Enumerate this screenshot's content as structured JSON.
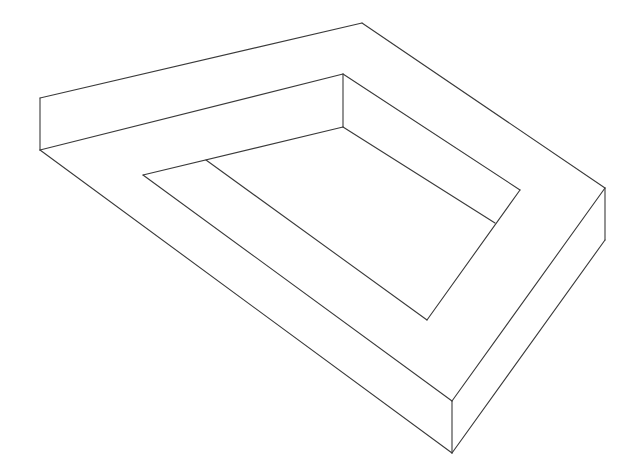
{
  "figure": {
    "background": "#ffffff",
    "stroke": "#3a3a3a",
    "width": 636,
    "height": 475,
    "segments": [
      {
        "name": "outer-top-left-edge",
        "x1": 40,
        "y1": 98,
        "x2": 362,
        "y2": 23
      },
      {
        "name": "outer-top-right-edge",
        "x1": 362,
        "y1": 23,
        "x2": 605,
        "y2": 188
      },
      {
        "name": "left-vertical-edge",
        "x1": 40,
        "y1": 98,
        "x2": 40,
        "y2": 150
      },
      {
        "name": "top-left-inner-rail",
        "x1": 40,
        "y1": 150,
        "x2": 343,
        "y2": 74
      },
      {
        "name": "inner-top-vertical-edge",
        "x1": 343,
        "y1": 74,
        "x2": 343,
        "y2": 127
      },
      {
        "name": "inner-top-left-edge",
        "x1": 343,
        "y1": 127,
        "x2": 143,
        "y2": 175
      },
      {
        "name": "top-right-inner-rail",
        "x1": 343,
        "y1": 74,
        "x2": 520,
        "y2": 190
      },
      {
        "name": "inner-top-right-edge",
        "x1": 343,
        "y1": 127,
        "x2": 495,
        "y2": 223
      },
      {
        "name": "inner-right-edge",
        "x1": 520,
        "y1": 190,
        "x2": 427,
        "y2": 320
      },
      {
        "name": "inner-branch-edge",
        "x1": 206,
        "y1": 160,
        "x2": 427,
        "y2": 320
      },
      {
        "name": "inner-left-edge",
        "x1": 143,
        "y1": 175,
        "x2": 452,
        "y2": 401
      },
      {
        "name": "outer-bottom-left-edge",
        "x1": 40,
        "y1": 150,
        "x2": 452,
        "y2": 453
      },
      {
        "name": "front-vertical-edge",
        "x1": 452,
        "y1": 401,
        "x2": 452,
        "y2": 453
      },
      {
        "name": "bottom-right-top-edge",
        "x1": 452,
        "y1": 401,
        "x2": 605,
        "y2": 188
      },
      {
        "name": "bottom-right-lower-edge",
        "x1": 452,
        "y1": 453,
        "x2": 605,
        "y2": 240
      },
      {
        "name": "right-vertical-edge",
        "x1": 605,
        "y1": 188,
        "x2": 605,
        "y2": 240
      }
    ]
  }
}
